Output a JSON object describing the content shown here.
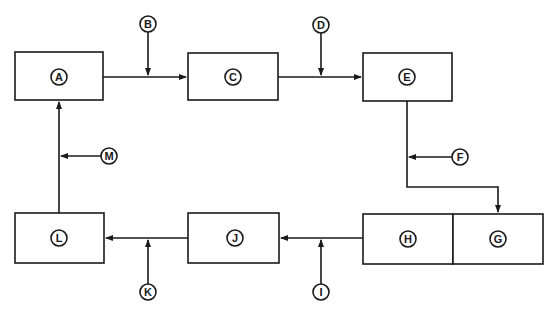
{
  "diagram": {
    "type": "block-flow",
    "colors": {
      "stroke": "#1a1a1a",
      "background": "#ffffff"
    },
    "blocks": [
      {
        "id": "A",
        "label": "A"
      },
      {
        "id": "C",
        "label": "C"
      },
      {
        "id": "E",
        "label": "E"
      },
      {
        "id": "H",
        "label": "H"
      },
      {
        "id": "G",
        "label": "G"
      },
      {
        "id": "J",
        "label": "J"
      },
      {
        "id": "L",
        "label": "L"
      }
    ],
    "inputs": [
      {
        "id": "B",
        "label": "B",
        "joins": "A-C"
      },
      {
        "id": "D",
        "label": "D",
        "joins": "C-E"
      },
      {
        "id": "F",
        "label": "F",
        "joins": "E-G"
      },
      {
        "id": "I",
        "label": "I",
        "joins": "H-J"
      },
      {
        "id": "K",
        "label": "K",
        "joins": "J-L"
      },
      {
        "id": "M",
        "label": "M",
        "joins": "L-A"
      }
    ],
    "flow": [
      "A",
      "C",
      "E",
      "G",
      "H",
      "J",
      "L",
      "A"
    ]
  }
}
